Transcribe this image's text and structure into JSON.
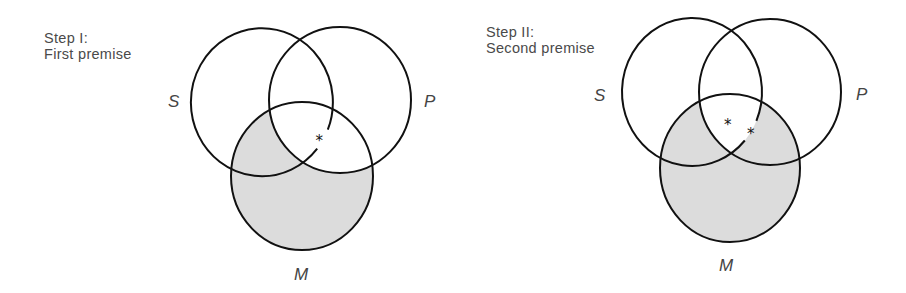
{
  "diagrams": [
    {
      "step": "Step I:",
      "title": "First premise",
      "labels": {
        "s": "S",
        "p": "P",
        "m": "M"
      },
      "shaded_region": "M outside P",
      "marks": [
        "*"
      ]
    },
    {
      "step": "Step II:",
      "title": "Second premise",
      "labels": {
        "s": "S",
        "p": "P",
        "m": "M"
      },
      "shaded_region": "M outside S∩P",
      "marks": [
        "*",
        "*"
      ]
    }
  ],
  "colors": {
    "stroke": "#111111",
    "shade": "#dcdcdc",
    "text": "#4a4a4a"
  }
}
